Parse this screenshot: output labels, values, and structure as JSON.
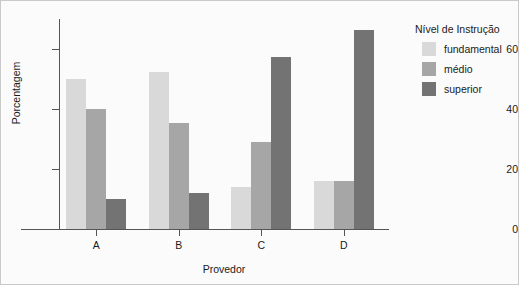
{
  "chart_data": {
    "type": "bar",
    "title": "",
    "xlabel": "Provedor",
    "ylabel": "Porcentagem",
    "categories": [
      "A",
      "B",
      "C",
      "D"
    ],
    "series": [
      {
        "name": "fundamental",
        "color": "#d9d9d9",
        "values": [
          50,
          52.5,
          14,
          16
        ]
      },
      {
        "name": "médio",
        "color": "#a6a6a6",
        "values": [
          40,
          35.5,
          29,
          16
        ]
      },
      {
        "name": "superior",
        "color": "#737373",
        "values": [
          10,
          12,
          57.5,
          66.5
        ]
      }
    ],
    "ylim": [
      0,
      70
    ],
    "yticks": [
      0,
      20,
      40,
      60
    ],
    "ytick_labels": [
      "0",
      "20",
      "40",
      "60"
    ],
    "grid": false,
    "legend": {
      "title": "Nível de Instrução",
      "position": "right",
      "entries": [
        "fundamental",
        "médio",
        "superior"
      ]
    }
  }
}
